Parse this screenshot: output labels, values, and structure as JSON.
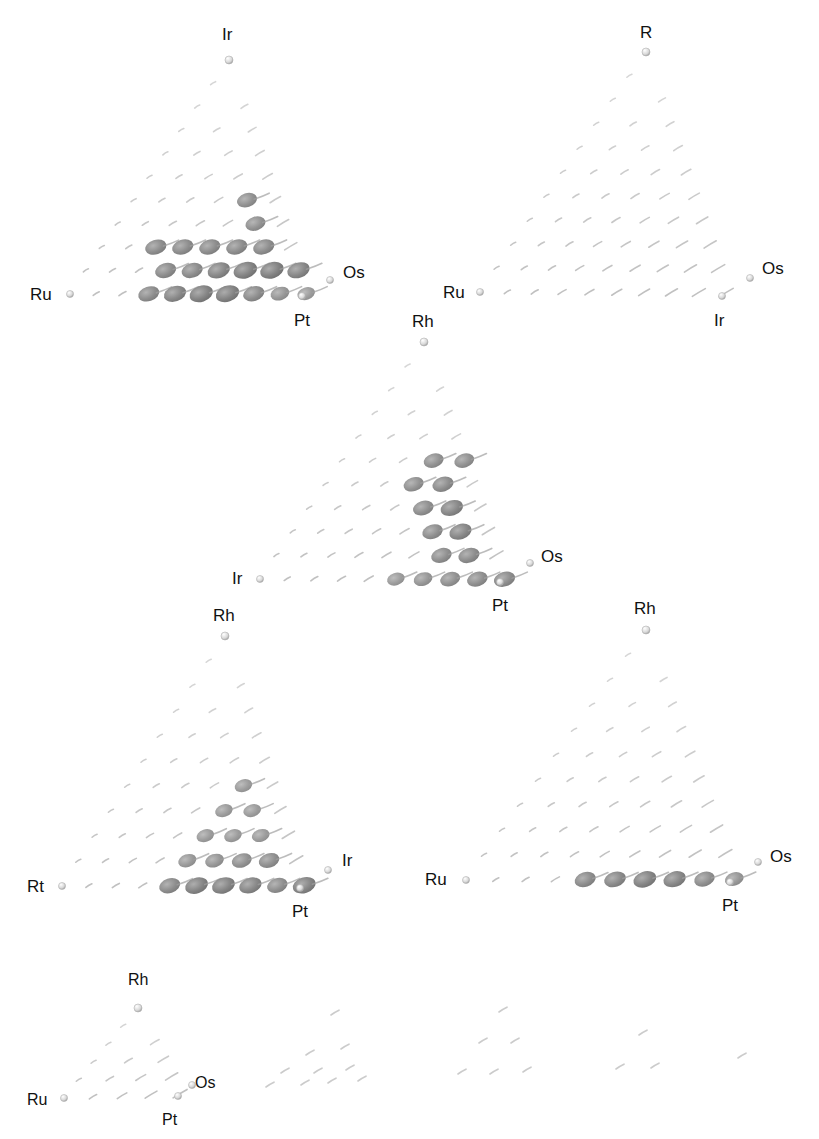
{
  "figure": {
    "colors": {
      "background": "#ffffff",
      "blob_dark": "#7a7a7a",
      "blob_mid": "#9a9a9a",
      "blob_light": "#c9c9c9",
      "label": "#111111"
    }
  },
  "panels": [
    {
      "id": "top-left",
      "labels": [
        {
          "text": "Ir",
          "x": 222,
          "y": 40
        },
        {
          "text": "Ru",
          "x": 30,
          "y": 300
        },
        {
          "text": "Os",
          "x": 343,
          "y": 278
        },
        {
          "text": "Pt",
          "x": 294,
          "y": 326
        }
      ],
      "apex": [
        229,
        60
      ],
      "left": [
        70,
        294
      ],
      "right": [
        302,
        296
      ],
      "back": [
        330,
        280
      ],
      "rows": 10,
      "strong": [
        [
          0,
          0,
          0,
          0,
          0,
          0,
          0,
          0,
          0,
          0
        ],
        [
          0,
          0,
          0,
          0,
          0,
          0,
          0,
          0,
          0,
          0
        ],
        [
          0,
          0,
          0,
          0,
          0,
          0,
          0,
          0,
          0,
          0
        ],
        [
          0,
          0,
          0,
          0,
          0,
          0,
          0,
          0,
          0,
          0
        ],
        [
          0,
          0,
          0,
          0,
          0,
          0,
          0,
          0,
          0,
          0
        ],
        [
          0,
          0,
          0,
          0,
          0.7,
          0,
          0,
          0,
          0,
          0
        ],
        [
          0,
          0,
          0,
          0,
          0,
          0.7,
          0,
          0,
          0,
          0
        ],
        [
          0,
          0,
          0.8,
          0.8,
          0.8,
          0.8,
          0.8,
          0,
          0,
          0
        ],
        [
          0,
          0,
          0,
          0.8,
          0.8,
          0.9,
          1,
          1,
          0.9,
          0
        ],
        [
          0,
          0,
          0,
          0.8,
          0.9,
          1,
          1,
          0.8,
          0.6,
          0.5
        ]
      ]
    },
    {
      "id": "top-right",
      "labels": [
        {
          "text": "R",
          "x": 640,
          "y": 38
        },
        {
          "text": "Ru",
          "x": 443,
          "y": 298
        },
        {
          "text": "Os",
          "x": 762,
          "y": 274
        },
        {
          "text": "Ir",
          "x": 714,
          "y": 326
        }
      ],
      "apex": [
        646,
        52
      ],
      "left": [
        480,
        292
      ],
      "right": [
        722,
        296
      ],
      "back": [
        750,
        278
      ],
      "rows": 10,
      "strong": []
    },
    {
      "id": "middle",
      "labels": [
        {
          "text": "Rh",
          "x": 412,
          "y": 327
        },
        {
          "text": "Ir",
          "x": 232,
          "y": 584
        },
        {
          "text": "Os",
          "x": 541,
          "y": 562
        },
        {
          "text": "Pt",
          "x": 492,
          "y": 611
        }
      ],
      "apex": [
        424,
        342
      ],
      "left": [
        260,
        579
      ],
      "right": [
        500,
        582
      ],
      "back": [
        530,
        563
      ],
      "rows": 10,
      "strong": [
        [
          0,
          0,
          0,
          0,
          0,
          0,
          0,
          0,
          0,
          0
        ],
        [
          0,
          0,
          0,
          0,
          0,
          0,
          0,
          0,
          0,
          0
        ],
        [
          0,
          0,
          0,
          0,
          0,
          0,
          0,
          0,
          0,
          0
        ],
        [
          0,
          0,
          0,
          0,
          0,
          0,
          0,
          0,
          0,
          0
        ],
        [
          0,
          0,
          0,
          0.7,
          0.7,
          0,
          0,
          0,
          0,
          0
        ],
        [
          0,
          0,
          0,
          0.7,
          0.8,
          0,
          0,
          0,
          0,
          0
        ],
        [
          0,
          0,
          0,
          0,
          0.75,
          0.9,
          0,
          0,
          0,
          0
        ],
        [
          0,
          0,
          0,
          0,
          0,
          0.75,
          0.9,
          0,
          0,
          0
        ],
        [
          0,
          0,
          0,
          0,
          0,
          0,
          0.75,
          0.8,
          0,
          0
        ],
        [
          0,
          0,
          0,
          0,
          0,
          0.5,
          0.6,
          0.7,
          0.75,
          0.8
        ]
      ]
    },
    {
      "id": "bottom-left",
      "labels": [
        {
          "text": "Rh",
          "x": 213,
          "y": 621
        },
        {
          "text": "Rt",
          "x": 27,
          "y": 892
        },
        {
          "text": "Ir",
          "x": 342,
          "y": 866
        },
        {
          "text": "Pt",
          "x": 292,
          "y": 917
        }
      ],
      "apex": [
        225,
        636
      ],
      "left": [
        62,
        886
      ],
      "right": [
        300,
        888
      ],
      "back": [
        328,
        870
      ],
      "rows": 10,
      "strong": [
        [
          0,
          0,
          0,
          0,
          0,
          0,
          0,
          0,
          0,
          0
        ],
        [
          0,
          0,
          0,
          0,
          0,
          0,
          0,
          0,
          0,
          0
        ],
        [
          0,
          0,
          0,
          0,
          0,
          0,
          0,
          0,
          0,
          0
        ],
        [
          0,
          0,
          0,
          0,
          0,
          0,
          0,
          0,
          0,
          0
        ],
        [
          0,
          0,
          0,
          0,
          0,
          0,
          0,
          0,
          0,
          0
        ],
        [
          0,
          0,
          0,
          0,
          0.5,
          0,
          0,
          0,
          0,
          0
        ],
        [
          0,
          0,
          0,
          0,
          0.5,
          0.5,
          0,
          0,
          0,
          0
        ],
        [
          0,
          0,
          0,
          0,
          0.5,
          0.5,
          0.5,
          0,
          0,
          0
        ],
        [
          0,
          0,
          0,
          0,
          0.55,
          0.6,
          0.7,
          0.75,
          0,
          0
        ],
        [
          0,
          0,
          0,
          0,
          0.8,
          0.95,
          0.95,
          0.9,
          0.75,
          0.95
        ]
      ]
    },
    {
      "id": "bottom-right",
      "labels": [
        {
          "text": "Rh",
          "x": 634,
          "y": 614
        },
        {
          "text": "Ru",
          "x": 425,
          "y": 885
        },
        {
          "text": "Os",
          "x": 770,
          "y": 862
        },
        {
          "text": "Pt",
          "x": 722,
          "y": 911
        }
      ],
      "apex": [
        646,
        630
      ],
      "left": [
        466,
        880
      ],
      "right": [
        730,
        882
      ],
      "back": [
        758,
        862
      ],
      "rows": 10,
      "strong": [
        [
          0,
          0,
          0,
          0,
          0,
          0,
          0,
          0,
          0,
          0
        ],
        [
          0,
          0,
          0,
          0,
          0,
          0,
          0,
          0,
          0,
          0
        ],
        [
          0,
          0,
          0,
          0,
          0,
          0,
          0,
          0,
          0,
          0
        ],
        [
          0,
          0,
          0,
          0,
          0,
          0,
          0,
          0,
          0,
          0
        ],
        [
          0,
          0,
          0,
          0,
          0,
          0,
          0,
          0,
          0,
          0
        ],
        [
          0,
          0,
          0,
          0,
          0,
          0,
          0,
          0,
          0,
          0
        ],
        [
          0,
          0,
          0,
          0,
          0,
          0,
          0,
          0,
          0,
          0
        ],
        [
          0,
          0,
          0,
          0,
          0,
          0,
          0,
          0,
          0,
          0
        ],
        [
          0,
          0,
          0,
          0,
          0,
          0,
          0,
          0,
          0,
          0
        ],
        [
          0,
          0,
          0,
          0,
          0.8,
          0.85,
          0.95,
          0.9,
          0.75,
          0.6
        ]
      ]
    },
    {
      "id": "bottom-strip",
      "labels": [
        {
          "text": "Rh",
          "x": 128,
          "y": 985
        },
        {
          "text": "Ru",
          "x": 27,
          "y": 1105
        },
        {
          "text": "Os",
          "x": 195,
          "y": 1088
        },
        {
          "text": "Pt",
          "x": 162,
          "y": 1125
        }
      ],
      "apex": [
        138,
        1008
      ],
      "left": [
        64,
        1098
      ],
      "right": [
        178,
        1096
      ],
      "back": [
        192,
        1085
      ],
      "rows": 5,
      "strong": []
    }
  ],
  "scattered_points": [
    [
      335,
      1013
    ],
    [
      310,
      1053
    ],
    [
      345,
      1047
    ],
    [
      285,
      1071
    ],
    [
      318,
      1071
    ],
    [
      350,
      1068
    ],
    [
      270,
      1085
    ],
    [
      305,
      1083
    ],
    [
      332,
      1081
    ],
    [
      362,
      1079
    ],
    [
      503,
      1010
    ],
    [
      483,
      1041
    ],
    [
      515,
      1041
    ],
    [
      462,
      1072
    ],
    [
      494,
      1072
    ],
    [
      527,
      1070
    ],
    [
      643,
      1033
    ],
    [
      620,
      1067
    ],
    [
      655,
      1066
    ],
    [
      742,
      1056
    ]
  ]
}
